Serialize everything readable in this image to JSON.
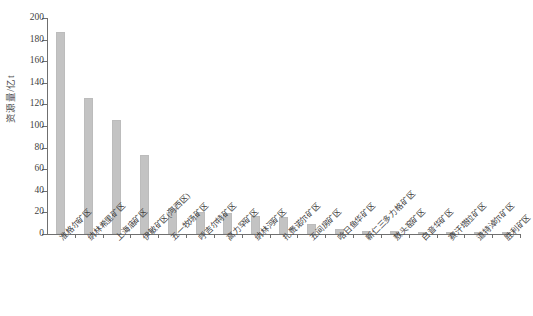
{
  "chart_data": {
    "type": "bar",
    "title": "",
    "subtitle": "",
    "xlabel": "",
    "ylabel": "资源量/亿t",
    "ylim": [
      0,
      200
    ],
    "yticks": [
      0,
      20,
      40,
      60,
      80,
      100,
      120,
      140,
      160,
      180,
      200
    ],
    "ytick_labels": [
      "0",
      "20",
      "40",
      "60",
      "80",
      "100",
      "120",
      "140",
      "160",
      "180",
      "200"
    ],
    "grid": false,
    "legend": null,
    "legend_position": "none",
    "bar_color": "#c3c3c3",
    "axis_color": "#6f6f6f",
    "categories": [
      "准格尔矿区",
      "纳林希里矿区",
      "上海庙矿区",
      "伊敏矿区(河西区)",
      "五一牧场矿区",
      "呼吉尔特矿区",
      "高力罕矿区",
      "纳林河矿区",
      "扎赉诺尔矿区",
      "五间房矿区",
      "哈日鱼华矿区",
      "新仁三多力格矿区",
      "敖头窑矿区",
      "白音华矿区",
      "赛汗塔拉矿区",
      "道特淖尔矿区",
      "胜利矿区"
    ],
    "values": [
      187,
      126,
      106,
      73,
      24,
      20,
      19,
      17,
      16,
      9,
      5,
      3,
      3,
      2,
      2,
      1,
      1
    ]
  }
}
